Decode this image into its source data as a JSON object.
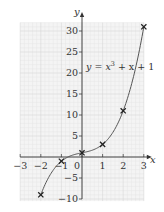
{
  "chart_data": {
    "type": "line",
    "title": "",
    "equation_label": "y = x³ + x + 1",
    "equation_parts": {
      "y": "y",
      "eq": " = ",
      "x": "x",
      "exp": "3",
      "rest": " + x + 1"
    },
    "xlabel": "x",
    "ylabel": "y",
    "xlim": [
      -3,
      3
    ],
    "ylim": [
      -10,
      30
    ],
    "grid": true,
    "x_ticks": [
      -3,
      -2,
      -1,
      0,
      1,
      2,
      3
    ],
    "x_tick_labels": [
      "−3",
      "−2",
      "−1",
      "0",
      "1",
      "2",
      "3"
    ],
    "y_ticks": [
      -10,
      -5,
      5,
      10,
      15,
      20,
      25,
      30
    ],
    "y_tick_labels": [
      "−10",
      "−5",
      "5",
      "10",
      "15",
      "20",
      "25",
      "30"
    ],
    "series": [
      {
        "name": "y = x^3 + x + 1",
        "function": "x^3 + x + 1",
        "curve_domain": [
          -2,
          3
        ],
        "marked_points": [
          {
            "x": -2,
            "y": -9
          },
          {
            "x": -1,
            "y": -1
          },
          {
            "x": 0,
            "y": 1
          },
          {
            "x": 1,
            "y": 3
          },
          {
            "x": 2,
            "y": 11
          },
          {
            "x": 3,
            "y": 31
          }
        ]
      }
    ],
    "colors": {
      "curve": "#555555",
      "axis": "#333333",
      "grid_minor": "#e6e6e6",
      "grid_major": "#d2d2d2",
      "grid_bg": "#f4f4f4"
    }
  }
}
